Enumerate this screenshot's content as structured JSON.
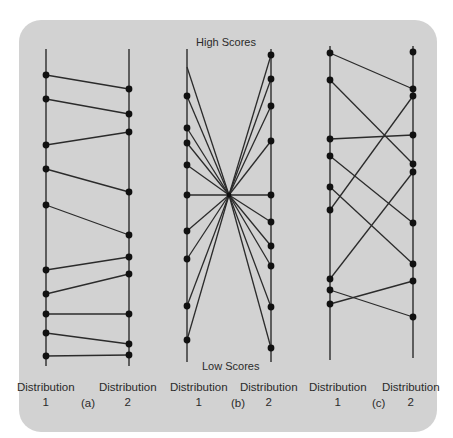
{
  "figure": {
    "background_color": "#d2d2d2",
    "line_color": "#2b2b2b",
    "dot_color": "#111111",
    "panels": [
      {
        "id": "a",
        "tag": "(a)",
        "left_label": {
          "title": "Distribution",
          "num": "1"
        },
        "right_label": {
          "title": "Distribution",
          "num": "2"
        },
        "left_axis": {
          "x": 46,
          "y1": 49,
          "y2": 366
        },
        "right_axis": {
          "x": 129,
          "y1": 49,
          "y2": 366
        },
        "pairs": [
          [
            75,
            89
          ],
          [
            99,
            114
          ],
          [
            145,
            132
          ],
          [
            169,
            192
          ],
          [
            205,
            235
          ],
          [
            270,
            257
          ],
          [
            294,
            274
          ],
          [
            314,
            314
          ],
          [
            333,
            344
          ],
          [
            356,
            355
          ]
        ],
        "extra_left_dots": [],
        "extra_right_dots": []
      },
      {
        "id": "b",
        "tag": "(b)",
        "top_label": "High Scores",
        "bottom_label": "Low Scores",
        "left_label": {
          "title": "Distribution",
          "num": "1"
        },
        "right_label": {
          "title": "Distribution",
          "num": "2"
        },
        "left_axis": {
          "x": 187,
          "y1": 49,
          "y2": 362
        },
        "right_axis": {
          "x": 271,
          "y1": 49,
          "y2": 362
        },
        "center": [
          229,
          195
        ],
        "left_points": [
          67,
          96,
          128,
          143,
          165,
          195,
          231,
          259,
          306,
          340
        ],
        "left_dots": [
          96,
          128,
          143,
          165,
          195,
          231,
          259,
          306,
          340
        ],
        "right_points": [
          55,
          79,
          106,
          141,
          195,
          222,
          246,
          266,
          307,
          348
        ]
      },
      {
        "id": "c",
        "tag": "(c)",
        "left_label": {
          "title": "Distribution",
          "num": "1"
        },
        "right_label": {
          "title": "Distribution",
          "num": "2"
        },
        "left_axis": {
          "x": 330,
          "y1": 46,
          "y2": 360
        },
        "right_axis": {
          "x": 413,
          "y1": 46,
          "y2": 358
        },
        "pairs": [
          [
            53,
            89
          ],
          [
            80,
            164
          ],
          [
            139,
            135
          ],
          [
            156,
            223
          ],
          [
            187,
            264
          ],
          [
            210,
            96
          ],
          [
            279,
            172
          ],
          [
            290,
            317
          ],
          [
            304,
            281
          ]
        ],
        "extra_left_dots": [],
        "extra_right_dots": [
          52
        ]
      }
    ]
  }
}
